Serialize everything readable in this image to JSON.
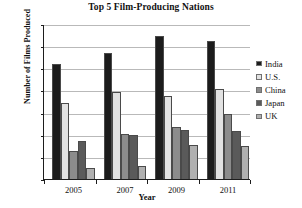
{
  "chart_data": {
    "type": "bar",
    "title": "Top 5 Film-Producing Nations",
    "xlabel": "Year",
    "ylabel": "Number of Films Produced",
    "categories": [
      "2005",
      "2007",
      "2009",
      "2011"
    ],
    "series": [
      {
        "name": "India",
        "values": [
          1045,
          1150,
          1300,
          1260
        ],
        "color": "#1c1c1c"
      },
      {
        "name": "U.S.",
        "values": [
          700,
          795,
          755,
          825
        ],
        "color": "#e2e2e2"
      },
      {
        "name": "China",
        "values": [
          260,
          415,
          480,
          595
        ],
        "color": "#8c8c8c"
      },
      {
        "name": "Japan",
        "values": [
          355,
          410,
          450,
          445
        ],
        "color": "#5a5a5a"
      },
      {
        "name": "UK",
        "values": [
          110,
          130,
          315,
          305
        ],
        "color": "#b0b0b0"
      }
    ],
    "ylim": [
      0,
      1400
    ],
    "yticks": [
      0,
      200,
      400,
      600,
      800,
      1000,
      1200,
      1400
    ],
    "ytick_labels": [
      "0",
      "200",
      "400",
      "600",
      "800",
      "1,000",
      "1,200",
      "1,400"
    ],
    "grid": true,
    "legend_position": "right"
  }
}
